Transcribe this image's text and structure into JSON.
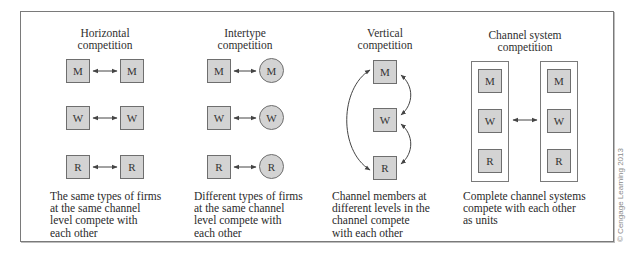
{
  "diagram": {
    "columns": [
      {
        "id": "horizontal",
        "title_line1": "Horizontal",
        "title_line2": "competition",
        "left_nodes": [
          "M",
          "W",
          "R"
        ],
        "right_nodes": [
          "M",
          "W",
          "R"
        ],
        "left_shape": "square",
        "right_shape": "square",
        "description": "The same types of firms\nat the same channel\nlevel compete with\neach other"
      },
      {
        "id": "intertype",
        "title_line1": "Intertype",
        "title_line2": "competition",
        "left_nodes": [
          "M",
          "W",
          "R"
        ],
        "right_nodes": [
          "M",
          "W",
          "R"
        ],
        "left_shape": "square",
        "right_shape": "circle",
        "description": "Different types of firms\nat the same channel\nlevel compete with\neach other"
      },
      {
        "id": "vertical",
        "title_line1": "Vertical",
        "title_line2": "competition",
        "nodes": [
          "M",
          "W",
          "R"
        ],
        "description": "Channel members at\ndifferent levels in the\nchannel compete\nwith each other"
      },
      {
        "id": "channel-system",
        "title_line1": "Channel system",
        "title_line2": "competition",
        "left_system": [
          "M",
          "W",
          "R"
        ],
        "right_system": [
          "M",
          "W",
          "R"
        ],
        "description": "Complete channel systems\ncompete with each other\nas units"
      }
    ],
    "credit": "© Cengage Learning 2013",
    "colors": {
      "node_fill": "#d3d3d3",
      "node_border": "#6e6e6e",
      "frame_border": "#7a7a7a",
      "arrow": "#444444",
      "text": "#2a2a2a"
    }
  }
}
